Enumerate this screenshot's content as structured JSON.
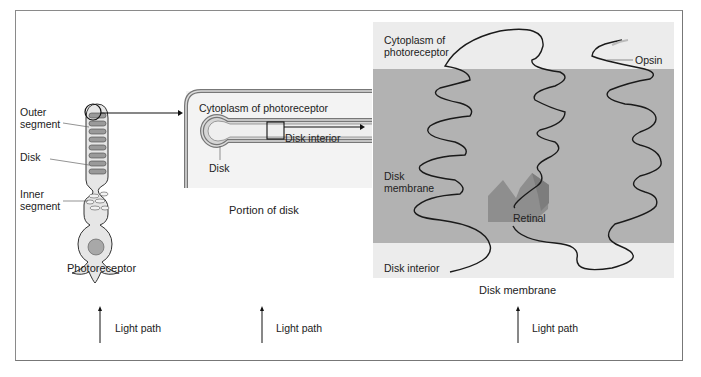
{
  "figure": {
    "panels": [
      {
        "id": "photoreceptor",
        "caption": "Photoreceptor",
        "labels": {
          "outer_segment_1": "Outer",
          "outer_segment_2": "segment",
          "disk": "Disk",
          "inner_segment_1": "Inner",
          "inner_segment_2": "segment"
        }
      },
      {
        "id": "portion-of-disk",
        "caption": "Portion of disk",
        "labels": {
          "cytoplasm": "Cytoplasm of photoreceptor",
          "disk_interior": "Disk interior",
          "disk": "Disk"
        }
      },
      {
        "id": "disk-membrane",
        "caption": "Disk membrane",
        "labels": {
          "cytoplasm_1": "Cytoplasm of",
          "cytoplasm_2": "photoreceptor",
          "opsin": "Opsin",
          "disk_membrane_1": "Disk",
          "disk_membrane_2": "membrane",
          "retinal": "Retinal",
          "disk_interior": "Disk interior"
        }
      }
    ],
    "light_path_label": "Light path",
    "colors": {
      "membrane_gray": "#b2b2b2",
      "cytoplasm_light": "#ececec",
      "retinal": "#8e8e8e",
      "disk_fill": "#9a9a9a",
      "cell_fill": "#e6e6e6",
      "line": "#1a1a1a"
    }
  }
}
